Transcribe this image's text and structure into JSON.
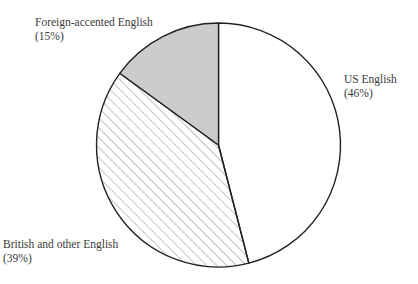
{
  "chart_data": {
    "type": "pie",
    "title": "",
    "start_angle_deg": 0,
    "direction": "clockwise",
    "slices": [
      {
        "label": "US English",
        "percent_label": "(46%)",
        "value": 46,
        "fill": "#ffffff",
        "pattern": "none"
      },
      {
        "label": "British and other English",
        "percent_label": "(39%)",
        "value": 39,
        "fill": "#ffffff",
        "pattern": "diagonal-hatch"
      },
      {
        "label": "Foreign-accented English",
        "percent_label": "(15%)",
        "value": 15,
        "fill": "#cccccc",
        "pattern": "none"
      }
    ],
    "legend": "none (direct labels)"
  },
  "style": {
    "stroke": "#222222",
    "hatch_color": "#777777",
    "gray_fill": "#cccccc"
  },
  "labels": {
    "us": {
      "name": "US English",
      "pct": "(46%)"
    },
    "british": {
      "name": "British and other English",
      "pct": "(39%)"
    },
    "foreign": {
      "name": "Foreign-accented English",
      "pct": "(15%)"
    }
  }
}
